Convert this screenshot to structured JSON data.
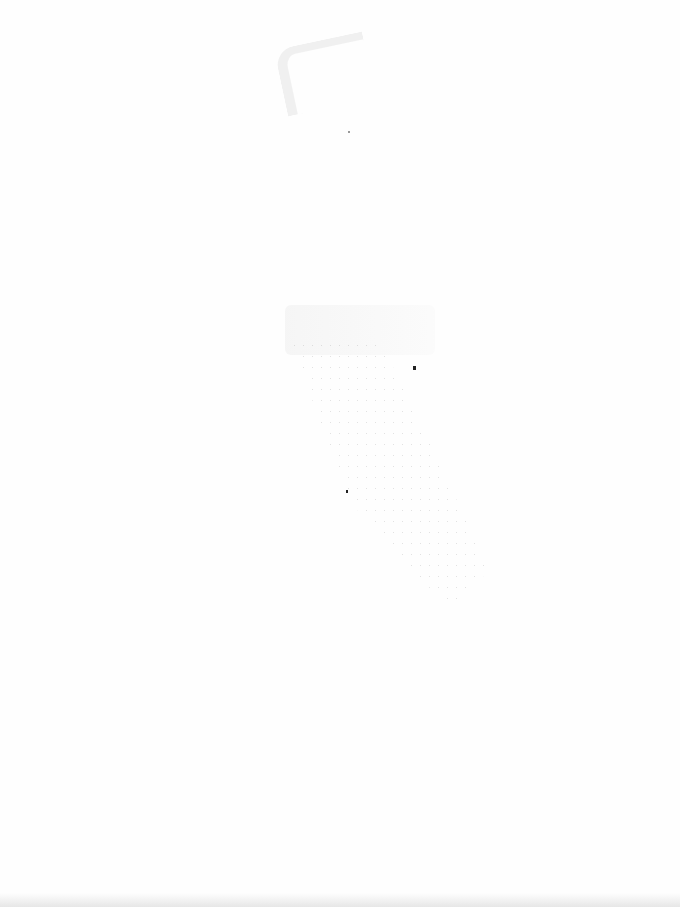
{
  "document": {
    "type": "scanned-blank-page",
    "text_content": "",
    "background_color": "#fefefe",
    "artifacts": [
      {
        "name": "bleed-through-top",
        "position": [
          280,
          40
        ]
      },
      {
        "name": "bleed-through-middle",
        "position": [
          285,
          305
        ]
      },
      {
        "name": "speckle-noise",
        "position": [
          290,
          340
        ]
      },
      {
        "name": "ink-dot",
        "position": [
          413,
          368
        ]
      },
      {
        "name": "ink-dot",
        "position": [
          346,
          491
        ]
      },
      {
        "name": "scan-edge-shadow",
        "position": [
          0,
          893
        ]
      }
    ]
  }
}
